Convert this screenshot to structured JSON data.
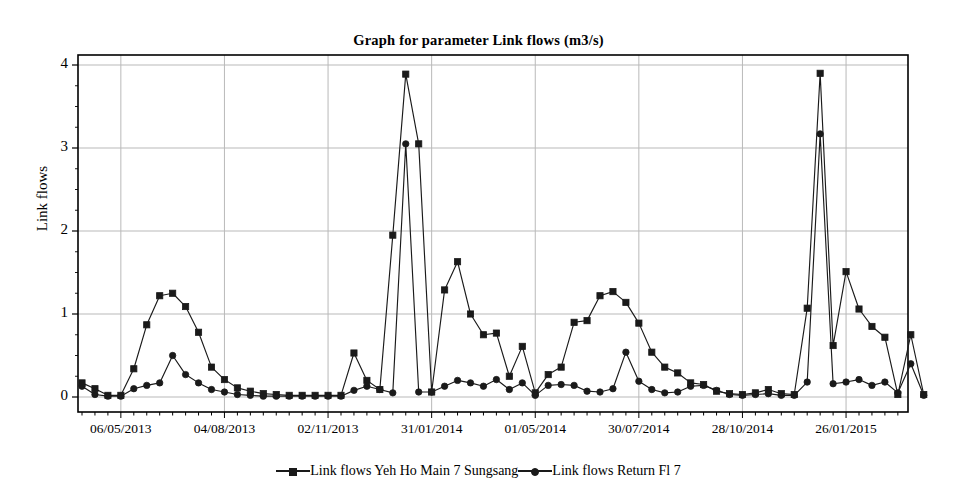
{
  "chart_data": {
    "type": "line",
    "title": "Graph for parameter Link flows (m3/s)",
    "xlabel": "",
    "ylabel": "Link flows",
    "ylim": [
      0,
      4
    ],
    "yticks": [
      0,
      1,
      2,
      3,
      4
    ],
    "grid": true,
    "legend_position": "bottom",
    "xtick_labels": [
      "06/05/2013",
      "04/08/2013",
      "02/11/2013",
      "31/01/2014",
      "01/05/2014",
      "30/07/2014",
      "28/10/2014",
      "26/01/2015"
    ],
    "xtick_indices": [
      3,
      11,
      19,
      27,
      35,
      43,
      51,
      59
    ],
    "x_count": 64,
    "series": [
      {
        "name": "Link flows Yeh Ho Main 7 Sungsang",
        "marker": "square",
        "color": "#1a1a1a",
        "values": [
          0.17,
          0.1,
          0.02,
          0.02,
          0.34,
          0.87,
          1.22,
          1.25,
          1.09,
          0.78,
          0.36,
          0.21,
          0.11,
          0.07,
          0.04,
          0.03,
          0.02,
          0.02,
          0.02,
          0.02,
          0.02,
          0.53,
          0.2,
          0.09,
          1.95,
          3.89,
          3.05,
          0.06,
          1.29,
          1.63,
          1.0,
          0.75,
          0.77,
          0.25,
          0.61,
          0.05,
          0.27,
          0.36,
          0.9,
          0.92,
          1.22,
          1.27,
          1.14,
          0.89,
          0.54,
          0.36,
          0.29,
          0.17,
          0.15,
          0.07,
          0.04,
          0.03,
          0.05,
          0.09,
          0.04,
          0.03,
          1.07,
          3.9,
          0.62,
          1.51,
          1.06,
          0.85,
          0.72,
          0.03,
          0.75,
          0.03
        ]
      },
      {
        "name": "Link flows Return Fl 7",
        "marker": "circle",
        "color": "#1a1a1a",
        "values": [
          0.13,
          0.03,
          0.01,
          0.01,
          0.1,
          0.14,
          0.17,
          0.5,
          0.27,
          0.17,
          0.09,
          0.06,
          0.03,
          0.02,
          0.01,
          0.01,
          0.01,
          0.01,
          0.01,
          0.01,
          0.01,
          0.08,
          0.13,
          0.09,
          0.05,
          3.05,
          0.06,
          0.06,
          0.13,
          0.2,
          0.17,
          0.13,
          0.21,
          0.09,
          0.17,
          0.02,
          0.14,
          0.15,
          0.14,
          0.07,
          0.06,
          0.1,
          0.54,
          0.19,
          0.09,
          0.05,
          0.06,
          0.13,
          0.14,
          0.08,
          0.03,
          0.02,
          0.03,
          0.04,
          0.02,
          0.02,
          0.18,
          3.17,
          0.16,
          0.18,
          0.21,
          0.14,
          0.18,
          0.05,
          0.4,
          0.02
        ]
      }
    ]
  },
  "legend": {
    "entries": [
      {
        "label": "Link flows Yeh Ho Main 7 Sungsang",
        "marker": "square-marker-icon"
      },
      {
        "label": "Link flows Return Fl 7",
        "marker": "circle-marker-icon"
      }
    ]
  },
  "axes": {
    "y_title": "Link flows",
    "y_labels": [
      "4",
      "3",
      "2",
      "1",
      "0"
    ],
    "x_labels": [
      "06/05/2013",
      "04/08/2013",
      "02/11/2013",
      "31/01/2014",
      "01/05/2014",
      "30/07/2014",
      "28/10/2014",
      "26/01/2015"
    ]
  },
  "colors": {
    "line": "#1a1a1a",
    "grid": "#b9b9b9",
    "frame": "#000000",
    "background": "#ffffff"
  }
}
